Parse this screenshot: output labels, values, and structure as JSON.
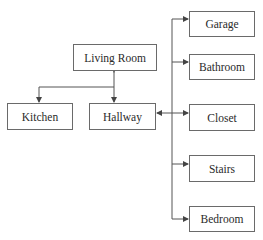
{
  "diagram": {
    "type": "floor-plan-connectivity",
    "nodes": [
      {
        "id": "living_room",
        "label": "Living Room"
      },
      {
        "id": "kitchen",
        "label": "Kitchen"
      },
      {
        "id": "hallway",
        "label": "Hallway"
      },
      {
        "id": "garage",
        "label": "Garage"
      },
      {
        "id": "bathroom",
        "label": "Bathroom"
      },
      {
        "id": "closet",
        "label": "Closet"
      },
      {
        "id": "stairs",
        "label": "Stairs"
      },
      {
        "id": "bedroom",
        "label": "Bedroom"
      }
    ],
    "edges": [
      {
        "from": "living_room",
        "to": "hallway",
        "direction": "both"
      },
      {
        "from": "living_room",
        "to": "kitchen",
        "direction": "forward"
      },
      {
        "from": "hallway",
        "to": "garage",
        "direction": "forward"
      },
      {
        "from": "hallway",
        "to": "bathroom",
        "direction": "forward"
      },
      {
        "from": "hallway",
        "to": "closet",
        "direction": "both"
      },
      {
        "from": "hallway",
        "to": "stairs",
        "direction": "forward"
      },
      {
        "from": "hallway",
        "to": "bedroom",
        "direction": "forward"
      }
    ],
    "colors": {
      "line": "#555555",
      "border": "#6a6a6a",
      "text": "#2a2a2a"
    }
  }
}
